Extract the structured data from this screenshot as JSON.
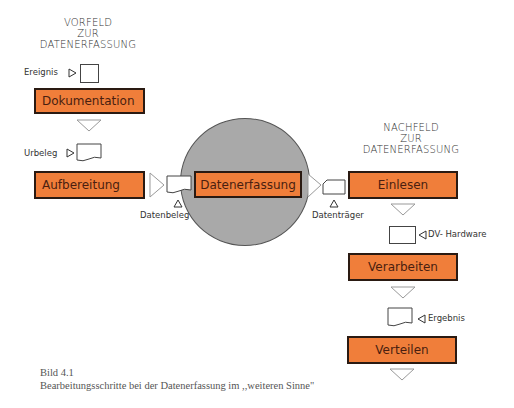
{
  "pre_field": {
    "heading_lines": [
      "VORFELD",
      "ZUR",
      "DATENERFASSUNG"
    ],
    "event_label": "Ereignis",
    "doc_label": "Urbeleg"
  },
  "post_field": {
    "heading_lines": [
      "NACHFELD",
      "ZUR",
      "DATENERFASSUNG"
    ],
    "hardware_label": "DV- Hardware",
    "result_label": "Ergebnis"
  },
  "steps": {
    "dokumentation": "Dokumentation",
    "aufbereitung": "Aufbereitung",
    "datenerfassung": "Datenerfassung",
    "einlesen": "Einlesen",
    "verarbeiten": "Verarbeiten",
    "verteilen": "Verteilen"
  },
  "media": {
    "datenbeleg": "Datenbeleg",
    "datentraeger": "Datenträger"
  },
  "caption": {
    "figure": "Bild 4.1",
    "text": "Bearbeitungsschritte bei der Datenerfassung im ,,weiteren Sinne\""
  },
  "colors": {
    "step_fill": "#f07e3a",
    "step_border": "#2a1a12",
    "circle_fill": "#a9a9a9"
  }
}
